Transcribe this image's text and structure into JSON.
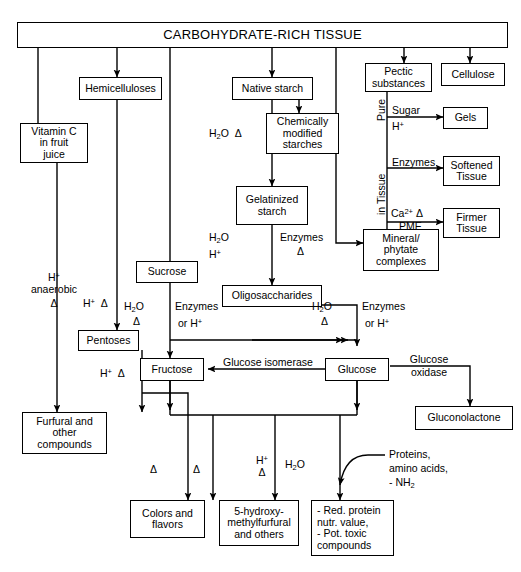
{
  "diagram": {
    "title": "CARBOHYDRATE-RICH TISSUE",
    "nodes": {
      "root": "CARBOHYDRATE-RICH TISSUE",
      "vitamin_c": "Vitamin C\nin fruit\njuice",
      "hemicelluloses": "Hemicelluloses",
      "native_starch": "Native starch",
      "chemically_modified": "Chemically\nmodified\nstarches",
      "gelatinized": "Gelatinized\nstarch",
      "pectic": "Pectic\nsubstances",
      "cellulose": "Cellulose",
      "gels": "Gels",
      "softened": "Softened\nTissue",
      "firmer": "Firmer\nTissue",
      "mineral": "Mineral/\nphytate\ncomplexes",
      "sucrose": "Sucrose",
      "oligosaccharides": "Oligosaccharides",
      "pentoses": "Pentoses",
      "fructose": "Fructose",
      "glucose": "Glucose",
      "gluconolactone": "Gluconolactone",
      "furfural": "Furfural and\nother\ncompounds",
      "colors": "Colors and\nflavors",
      "hmf": "5-hydroxy-\nmethylfurfural\nand others",
      "protein_effects": "- Red. protein\n   nutr. value,\n- Pot. toxic\n   compounds"
    },
    "edge_labels": {
      "pure": "Pure",
      "in_tissue": "in Tissue",
      "sugar": "Sugar",
      "sugar_h": "H+",
      "enzymes_pectic": "Enzymes",
      "ca_pme_top": "Ca2+ Δ",
      "ca_pme_bottom": "PME",
      "starch_h2o": "H2O",
      "starch_delta": "Δ",
      "gel_h2o": "H2O",
      "gel_h": "H+",
      "gel_enzymes": "Enzymes",
      "gel_delta": "Δ",
      "vitc_h": "H+",
      "vitc_anaerobic": "anaerobic",
      "vitc_delta": "Δ",
      "hemi_h_delta": "H+  Δ",
      "pentose_h_delta": "H+  Δ",
      "sucrose_h2o": "H2O",
      "sucrose_delta": "Δ",
      "sucrose_enzymes": "Enzymes",
      "sucrose_or_h": "or H+",
      "oligo_h2o": "H2O",
      "oligo_delta": "Δ",
      "oligo_enzymes": "Enzymes",
      "oligo_or_h": "or H+",
      "glucose_isomerase": "Glucose isomerase",
      "glucose_oxidase": "Glucose\noxidase",
      "delta_colors_left": "Δ",
      "delta_colors_right": "Δ",
      "hmf_h": "H+",
      "hmf_delta": "Δ",
      "hmf_h2o": "H2O",
      "proteins": "Proteins,\namino acids,\n- NH2"
    },
    "colors": {
      "ink": "#000000",
      "paper": "#ffffff"
    }
  }
}
